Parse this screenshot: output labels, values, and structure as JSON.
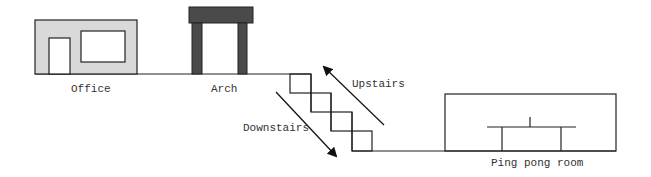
{
  "diagram": {
    "title": "",
    "colors": {
      "line": "#222222",
      "office_fill": "#d9d9d9",
      "arch_fill": "#4a4a4a",
      "background": "#ffffff"
    },
    "labels": {
      "office": "Office",
      "arch": "Arch",
      "upstairs": "Upstairs",
      "downstairs": "Downstairs",
      "ping_pong_room": "Ping pong room"
    },
    "nodes": [
      {
        "id": "office",
        "label": "Office",
        "shape": "building with door and window"
      },
      {
        "id": "arch",
        "label": "Arch",
        "shape": "gateway arch"
      },
      {
        "id": "stairs",
        "label": "",
        "shape": "staircase, 4 steps"
      },
      {
        "id": "ping_pong_room",
        "label": "Ping pong room",
        "shape": "room with ping pong table"
      }
    ],
    "edges": [
      {
        "from": "arch",
        "to": "ping_pong_room",
        "label": "Downstairs",
        "direction": "down-right"
      },
      {
        "from": "ping_pong_room",
        "to": "arch",
        "label": "Upstairs",
        "direction": "up-left"
      }
    ]
  }
}
